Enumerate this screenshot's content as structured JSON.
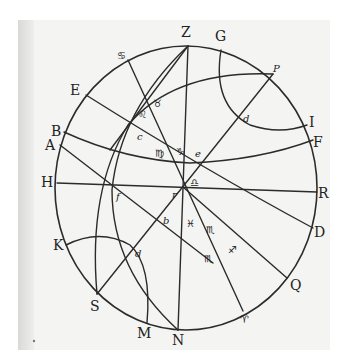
{
  "diagram": {
    "type": "spherical-astronomy-figure",
    "style": "historical woodcut / engraved print",
    "colors": {
      "ink": "#2b2b2b",
      "paper": "#f4f4f2",
      "background": "#ffffff"
    },
    "rim_points": [
      {
        "id": "Z",
        "label": "Z"
      },
      {
        "id": "G",
        "label": "G"
      },
      {
        "id": "P",
        "label": "P"
      },
      {
        "id": "I",
        "label": "I"
      },
      {
        "id": "F",
        "label": "F"
      },
      {
        "id": "R",
        "label": "R"
      },
      {
        "id": "D",
        "label": "D"
      },
      {
        "id": "Q",
        "label": "Q"
      },
      {
        "id": "aries_bottom",
        "label": "♈"
      },
      {
        "id": "N",
        "label": "N"
      },
      {
        "id": "M",
        "label": "M"
      },
      {
        "id": "S",
        "label": "S"
      },
      {
        "id": "K",
        "label": "K"
      },
      {
        "id": "H",
        "label": "H"
      },
      {
        "id": "A",
        "label": "A"
      },
      {
        "id": "B",
        "label": "B"
      },
      {
        "id": "E",
        "label": "E"
      },
      {
        "id": "cancer_top",
        "label": "♋"
      }
    ],
    "inner_points": [
      {
        "id": "d_upper",
        "label": "d"
      },
      {
        "id": "e",
        "label": "e"
      },
      {
        "id": "c",
        "label": "c"
      },
      {
        "id": "f",
        "label": "f"
      },
      {
        "id": "b",
        "label": "b"
      },
      {
        "id": "d_lower",
        "label": "d"
      },
      {
        "id": "r",
        "label": "r"
      }
    ],
    "zodiac_marks": [
      {
        "id": "taurus",
        "label": "♉"
      },
      {
        "id": "leo",
        "label": "♌"
      },
      {
        "id": "virgo",
        "label": "♍"
      },
      {
        "id": "capricorn",
        "label": "♑"
      },
      {
        "id": "libra",
        "label": "♎"
      },
      {
        "id": "pisces",
        "label": "♓"
      },
      {
        "id": "scorpio",
        "label": "♏"
      },
      {
        "id": "sagittarius",
        "label": "♐"
      },
      {
        "id": "scorpio_lower",
        "label": "♏"
      }
    ]
  }
}
